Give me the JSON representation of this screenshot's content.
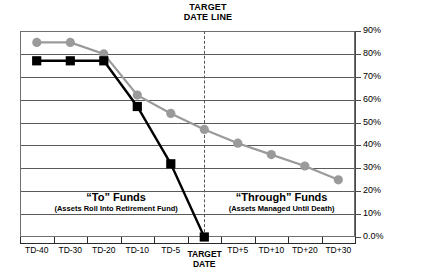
{
  "annotations": {
    "target_date_line_label": "TARGET\nDATE LINE",
    "region_left_title": "“To” Funds",
    "region_left_sub": "(Assets Roll Into Retirement Fund)",
    "region_right_title": "“Through” Funds",
    "region_right_sub": "(Assets Managed Until Death)"
  },
  "colors": {
    "to_series": "#000000",
    "through_series": "#9a9a9a",
    "grid": "#5a5a5a",
    "axis": "#2b2b2b",
    "background": "#ffffff"
  },
  "chart_data": {
    "type": "line",
    "title": "",
    "xlabel": "",
    "ylabel": "Equity as a % of Portfolio",
    "ylim": [
      0,
      90
    ],
    "ytick_labels": [
      "90%",
      "80%",
      "70%",
      "60%",
      "50%",
      "40%",
      "30%",
      "20%",
      "10%",
      "0.0%"
    ],
    "ytick_values": [
      90,
      80,
      70,
      60,
      50,
      40,
      30,
      20,
      10,
      0
    ],
    "categories": [
      "TD-40",
      "TD-30",
      "TD-20",
      "TD-10",
      "TD-5",
      "TARGET\nDATE",
      "TD+5",
      "TD+10",
      "TD+20",
      "TD+30"
    ],
    "grid": true,
    "legend": "none",
    "series": [
      {
        "name": "“Through” Funds",
        "marker": "circle",
        "color": "#9a9a9a",
        "x": [
          "TD-40",
          "TD-30",
          "TD-20",
          "TD-10",
          "TD-5",
          "TARGET DATE",
          "TD+5",
          "TD+10",
          "TD+20",
          "TD+30"
        ],
        "values": [
          85,
          85,
          80,
          62,
          54,
          47,
          41,
          36,
          31,
          25
        ]
      },
      {
        "name": "“To” Funds",
        "marker": "square",
        "color": "#000000",
        "x": [
          "TD-40",
          "TD-30",
          "TD-20",
          "TD-10",
          "TD-5",
          "TARGET DATE"
        ],
        "values": [
          77,
          77,
          77,
          57,
          32,
          0
        ]
      }
    ],
    "annotations": [
      {
        "type": "vline",
        "at": "TARGET DATE",
        "style": "dashed",
        "label": "TARGET DATE LINE"
      },
      {
        "type": "region",
        "side": "left",
        "title": "“To” Funds",
        "subtitle": "(Assets Roll Into Retirement Fund)"
      },
      {
        "type": "region",
        "side": "right",
        "title": "“Through” Funds",
        "subtitle": "(Assets Managed Until Death)"
      }
    ]
  }
}
